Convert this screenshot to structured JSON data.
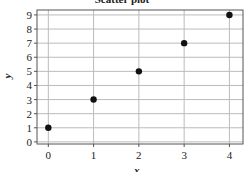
{
  "chart_data": {
    "type": "scatter",
    "title": "Scatter plot",
    "xlabel": "x",
    "ylabel": "y",
    "x": [
      0,
      1,
      2,
      3,
      4
    ],
    "y": [
      1,
      3,
      5,
      7,
      9
    ],
    "series": [
      {
        "name": "points",
        "x": [
          0,
          1,
          2,
          3,
          4
        ],
        "y": [
          1,
          3,
          5,
          7,
          9
        ],
        "color": "#111111"
      }
    ],
    "xticks": [
      0,
      1,
      2,
      3,
      4
    ],
    "yticks": [
      0,
      1,
      2,
      3,
      4,
      5,
      6,
      7,
      8,
      9
    ],
    "xlim": [
      -0.25,
      4.3
    ],
    "ylim": [
      -0.15,
      9.35
    ],
    "grid": true,
    "legend": null
  },
  "colors": {
    "grid": "#bbbbbb",
    "axis": "#555555",
    "marker": "#111111"
  }
}
